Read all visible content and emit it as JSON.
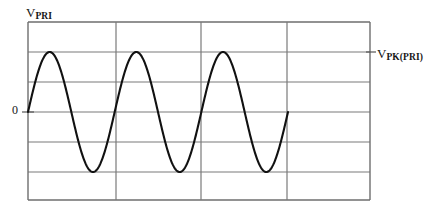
{
  "figure": {
    "y_axis_label": {
      "base": "V",
      "subscript": "PRI"
    },
    "peak_label": {
      "base": "V",
      "subscript": "PK(PRI)"
    },
    "zero_label": "0"
  },
  "style": {
    "grid_color": "#7a7a7a",
    "border_color": "#6e6e6e",
    "wave_color": "#111111",
    "background": "#ffffff"
  },
  "chart_data": {
    "type": "line",
    "title": "",
    "xlabel": "",
    "ylabel": "V_PRI",
    "grid": true,
    "legend": false,
    "annotations": [
      "V_PRI",
      "V_PK(PRI)",
      "0"
    ],
    "axis": {
      "x_pixel_range": [
        28,
        370
      ],
      "y_pixel_range": [
        22,
        200
      ],
      "x_gridlines_px": [
        28,
        116,
        201,
        287,
        370
      ],
      "y_gridlines_px": [
        22,
        52,
        82,
        112,
        142,
        172,
        200
      ],
      "zero_line_px": 112,
      "peak_line_px": 52,
      "trough_line_px": 172
    },
    "waveform": {
      "shape": "sine",
      "cycles": 3,
      "amplitude": 1.0,
      "offset": 0.0,
      "phase_deg": 0,
      "start_x_px": 28,
      "end_x_px": 288,
      "period_px": 86.7,
      "peak_value": "V_PK(PRI)",
      "trough_value": "-V_PK(PRI)",
      "baseline_value": 0
    },
    "x": [
      0,
      0.25,
      0.5,
      0.75,
      1,
      1.25,
      1.5,
      1.75,
      2,
      2.25,
      2.5,
      2.75,
      3
    ],
    "values": [
      0,
      1,
      0,
      -1,
      0,
      1,
      0,
      -1,
      0,
      1,
      0,
      -1,
      0
    ],
    "ylim": [
      -1.5,
      1.5
    ],
    "xlim": [
      0,
      3.95
    ]
  }
}
